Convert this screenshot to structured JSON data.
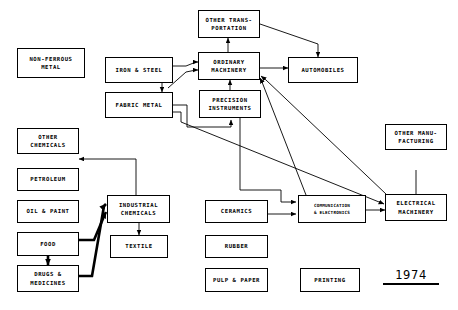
{
  "diagram": {
    "year_label": "1974",
    "stroke_color": "#000000",
    "background_color": "#ffffff",
    "nodes": [
      {
        "id": "non_ferrous_metal",
        "label": "NON-FERROUS\nMETAL",
        "x": 17,
        "y": 48,
        "w": 68,
        "h": 30
      },
      {
        "id": "iron_and_steel",
        "label": "IRON & STEEL",
        "x": 105,
        "y": 57,
        "w": 68,
        "h": 26
      },
      {
        "id": "fabric_metal",
        "label": "FABRIC METAL",
        "x": 105,
        "y": 92,
        "w": 68,
        "h": 26
      },
      {
        "id": "other_transportation",
        "label": "OTHER TRANS-\nPORTATION",
        "x": 198,
        "y": 10,
        "w": 62,
        "h": 28
      },
      {
        "id": "ordinary_machinery",
        "label": "ORDINARY\nMACHINERY",
        "x": 198,
        "y": 52,
        "w": 62,
        "h": 28
      },
      {
        "id": "precision_instruments",
        "label": "PRECISION\nINSTRUMENTS",
        "x": 199,
        "y": 90,
        "w": 62,
        "h": 28
      },
      {
        "id": "automobiles",
        "label": "AUTOMOBILES",
        "x": 288,
        "y": 57,
        "w": 70,
        "h": 26
      },
      {
        "id": "other_chemicals",
        "label": "OTHER\nCHEMICALS",
        "x": 17,
        "y": 128,
        "w": 62,
        "h": 26
      },
      {
        "id": "petroleum",
        "label": "PETROLEUM",
        "x": 17,
        "y": 168,
        "w": 62,
        "h": 23
      },
      {
        "id": "oil_and_paint",
        "label": "OIL & PAINT",
        "x": 17,
        "y": 200,
        "w": 62,
        "h": 23
      },
      {
        "id": "food",
        "label": "FOOD",
        "x": 17,
        "y": 232,
        "w": 62,
        "h": 24
      },
      {
        "id": "drugs_and_medicines",
        "label": "DRUGS &\nMEDICINES",
        "x": 17,
        "y": 265,
        "w": 62,
        "h": 27
      },
      {
        "id": "industrial_chemicals",
        "label": "INDUSTRIAL\nCHEMICALS",
        "x": 107,
        "y": 195,
        "w": 63,
        "h": 28
      },
      {
        "id": "textile",
        "label": "TEXTILE",
        "x": 110,
        "y": 235,
        "w": 58,
        "h": 23
      },
      {
        "id": "ceramics",
        "label": "CERAMICS",
        "x": 205,
        "y": 200,
        "w": 63,
        "h": 23
      },
      {
        "id": "rubber",
        "label": "RUBBER",
        "x": 205,
        "y": 235,
        "w": 63,
        "h": 23
      },
      {
        "id": "pulp_and_paper",
        "label": "PULP & PAPER",
        "x": 205,
        "y": 268,
        "w": 63,
        "h": 24
      },
      {
        "id": "printing",
        "label": "PRINTING",
        "x": 300,
        "y": 268,
        "w": 60,
        "h": 24
      },
      {
        "id": "communication_electronics",
        "label": "COMMUNICATION\n& ELECTRONICS",
        "x": 298,
        "y": 195,
        "w": 68,
        "h": 28,
        "small": true
      },
      {
        "id": "other_manufacturing",
        "label": "OTHER MANU-\nFACTURING",
        "x": 385,
        "y": 124,
        "w": 62,
        "h": 26
      },
      {
        "id": "electrical_machinery",
        "label": "ELECTRICAL\nMACHINERY",
        "x": 385,
        "y": 194,
        "w": 62,
        "h": 27
      }
    ],
    "edges": [
      {
        "id": "iron-to-ordinary",
        "from": "iron_and_steel",
        "to": "ordinary_machinery"
      },
      {
        "id": "fabric-to-ordinary",
        "from": "fabric_metal",
        "to": "ordinary_machinery"
      },
      {
        "id": "iron-to-fabric",
        "from": "iron_and_steel",
        "to": "fabric_metal"
      },
      {
        "id": "ordinary-to-transportation",
        "from": "ordinary_machinery",
        "to": "other_transportation"
      },
      {
        "id": "transportation-to-automobiles",
        "from": "other_transportation",
        "to": "automobiles"
      },
      {
        "id": "ordinary-to-automobiles",
        "from": "ordinary_machinery",
        "to": "automobiles"
      },
      {
        "id": "precision-to-ordinary",
        "from": "precision_instruments",
        "to": "ordinary_machinery"
      },
      {
        "id": "communication-to-ordinary",
        "from": "communication_electronics",
        "to": "ordinary_machinery"
      },
      {
        "id": "electrical-to-ordinary",
        "from": "electrical_machinery",
        "to": "ordinary_machinery"
      },
      {
        "id": "fabric-to-electrical",
        "from": "fabric_metal",
        "to": "electrical_machinery"
      },
      {
        "id": "fabric-to-precision",
        "from": "fabric_metal",
        "to": "precision_instruments"
      },
      {
        "id": "ceramics-to-communication",
        "from": "ceramics",
        "to": "communication_electronics"
      },
      {
        "id": "communication-to-electrical",
        "from": "communication_electronics",
        "to": "electrical_machinery"
      },
      {
        "id": "electrical-to-manufacturing",
        "from": "electrical_machinery",
        "to": "other_manufacturing"
      },
      {
        "id": "industrial-to-otherchem",
        "from": "industrial_chemicals",
        "to": "other_chemicals"
      },
      {
        "id": "industrial-to-textile",
        "from": "industrial_chemicals",
        "to": "textile"
      },
      {
        "id": "food-to-industrial",
        "from": "food",
        "to": "industrial_chemicals",
        "weight": "thick"
      },
      {
        "id": "drugs-to-industrial",
        "from": "drugs_and_medicines",
        "to": "industrial_chemicals",
        "weight": "thick"
      },
      {
        "id": "food-to-drugs",
        "from": "food",
        "to": "drugs_and_medicines",
        "weight": "thick"
      }
    ]
  }
}
